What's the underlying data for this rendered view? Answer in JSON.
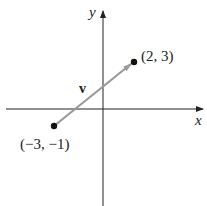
{
  "diagram": {
    "type": "vector-on-coordinate-plane",
    "axes": {
      "x_label": "x",
      "y_label": "y"
    },
    "vector": {
      "label": "v",
      "tail": {
        "x": -3,
        "y": -1,
        "label": "(−3, −1)"
      },
      "head": {
        "x": 2,
        "y": 3,
        "label": "(2, 3)"
      },
      "color": "#999999"
    },
    "colors": {
      "axis": "#222222",
      "point": "#111111",
      "vector": "#9a9a9a",
      "background": "#ffffff"
    }
  }
}
